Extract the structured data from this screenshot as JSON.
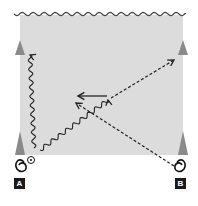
{
  "diagram": {
    "type": "drill-diagram",
    "colors": {
      "field": "#dcdcdc",
      "line": "#222222",
      "cone": "#8a8a8a",
      "label_bg": "#1a1a1a",
      "label_text": "#ffffff"
    },
    "field": {
      "x": 20,
      "y": 15,
      "width": 163,
      "height": 140
    },
    "top_boundary": {
      "style": "wavy"
    },
    "cones": [
      {
        "id": "cone-left-top",
        "x": 20,
        "y": 47
      },
      {
        "id": "cone-left-bottom",
        "x": 20,
        "y": 140
      },
      {
        "id": "cone-right-top",
        "x": 183,
        "y": 47
      },
      {
        "id": "cone-right-bottom",
        "x": 183,
        "y": 140
      }
    ],
    "players": [
      {
        "id": "A",
        "label": "A",
        "x": 19,
        "y": 166,
        "has_ball": true
      },
      {
        "id": "B",
        "label": "B",
        "x": 180,
        "y": 166,
        "has_ball": false
      }
    ],
    "paths": [
      {
        "id": "dribble-A-up",
        "style": "wavy",
        "from": [
          34,
          148
        ],
        "to": [
          30,
          55
        ],
        "meaning": "dribble"
      },
      {
        "id": "dribble-A-center",
        "style": "wavy",
        "from": [
          40,
          150
        ],
        "to": [
          108,
          100
        ],
        "meaning": "dribble"
      },
      {
        "id": "pass-solid",
        "style": "solid",
        "from": [
          107,
          96
        ],
        "to": [
          78,
          96
        ],
        "meaning": "movement"
      },
      {
        "id": "run-B-center",
        "style": "dashed",
        "from": [
          174,
          166
        ],
        "to": [
          76,
          103
        ],
        "meaning": "run"
      },
      {
        "id": "run-center-topright",
        "style": "dashed",
        "from": [
          111,
          98
        ],
        "to": [
          174,
          60
        ],
        "meaning": "run"
      }
    ]
  }
}
